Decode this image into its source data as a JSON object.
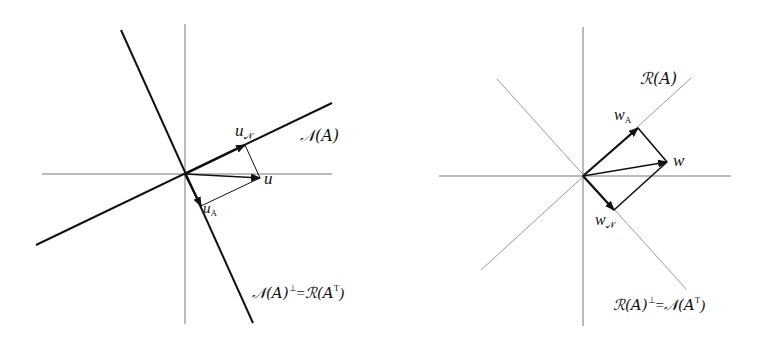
{
  "left_diagram": {
    "title": "Null space decomposition",
    "origin": [
      185,
      174
    ],
    "axes": {
      "x": [
        42,
        332
      ],
      "y": [
        24,
        324
      ]
    },
    "lines": [
      {
        "name": "null-space-line",
        "from": [
          36,
          245
        ],
        "to": [
          332,
          103
        ],
        "label": "𝒩(A)"
      },
      {
        "name": "null-space-perp-line",
        "from": [
          121,
          30
        ],
        "to": [
          253,
          323
        ],
        "label": "𝒩(A)⊥ = ℛ(Aᵀ)"
      }
    ],
    "vectors": [
      {
        "name": "u_N",
        "to": [
          245,
          145
        ]
      },
      {
        "name": "u",
        "to": [
          260,
          178
        ]
      },
      {
        "name": "u_A",
        "to": [
          201,
          206
        ]
      }
    ],
    "labels": {
      "u": "u",
      "u_N_base": "u",
      "u_N_sub": "𝒩",
      "u_A_base": "u",
      "u_A_sub": "A",
      "null_space": "𝒩(A)",
      "perp_lhs": "𝒩(A)",
      "perp_sup": "⊥",
      "perp_eq": "=",
      "perp_rhs": "ℛ(A",
      "perp_rhs_sup": "T",
      "perp_close": ")"
    }
  },
  "right_diagram": {
    "title": "Range space decomposition",
    "origin": [
      583,
      176
    ],
    "axes": {
      "x": [
        439,
        731
      ],
      "y": [
        27,
        326
      ]
    },
    "lines": [
      {
        "name": "range-line",
        "from": [
          481,
          270
        ],
        "to": [
          691,
          78
        ],
        "label": "ℛ(A)"
      },
      {
        "name": "range-perp-line",
        "from": [
          497,
          79
        ],
        "to": [
          686,
          289
        ],
        "label": "ℛ(A)⊥ = 𝒩(Aᵀ)"
      }
    ],
    "vectors": [
      {
        "name": "w_A",
        "to": [
          638,
          128
        ]
      },
      {
        "name": "w",
        "to": [
          667,
          162
        ]
      },
      {
        "name": "w_N",
        "to": [
          614,
          210
        ]
      }
    ],
    "labels": {
      "w": "w",
      "w_A_base": "w",
      "w_A_sub": "A",
      "w_N_base": "w",
      "w_N_sub": "𝒩",
      "range": "ℛ(A)",
      "perp_lhs": "ℛ(A)",
      "perp_sup": "⊥",
      "perp_eq": "=",
      "perp_rhs": "𝒩(A",
      "perp_rhs_sup": "T",
      "perp_close": ")"
    }
  },
  "colors": {
    "ink": "#111111",
    "axis": "#777777",
    "thin_line": "#999999"
  }
}
